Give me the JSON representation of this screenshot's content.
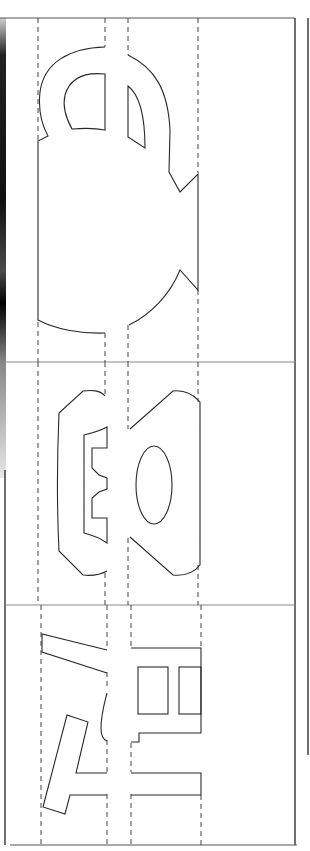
{
  "document": {
    "type": "pop-up card cutting template (scanned)",
    "text": "",
    "colors": {
      "background": "#ffffff",
      "line": "#2a2a2a",
      "divider": "#8a8a8a"
    }
  },
  "panels": [
    {
      "index": 1,
      "name": "mug",
      "description": "Cup / mug silhouette with handle, split along two fold columns"
    },
    {
      "index": 2,
      "name": "telephone",
      "description": "Telephone handset with oval dial, split along two fold columns"
    },
    {
      "index": 3,
      "name": "abstract-letters",
      "description": "Angled bar shapes and rectangular frame with two window cut-outs"
    }
  ],
  "fold_lines": {
    "style": "dashed",
    "x_positions": [
      38,
      105,
      128,
      198
    ]
  },
  "panel_dividers": {
    "y_positions": [
      362,
      605
    ]
  }
}
